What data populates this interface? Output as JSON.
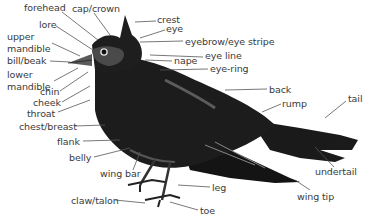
{
  "diagram": {
    "colors": {
      "background": "#ffffff",
      "label_text": "#3a3a3a",
      "leader_line": "#555555",
      "bird_body": "#1a1a1a",
      "bird_highlight": "#6a6a6a"
    },
    "labels": [
      {
        "id": "forehead",
        "text": "forehead",
        "x": 24,
        "y": 6
      },
      {
        "id": "cap-crown",
        "text": "cap/crown",
        "x": 72,
        "y": 7
      },
      {
        "id": "crest",
        "text": "crest",
        "x": 157,
        "y": 17
      },
      {
        "id": "eye",
        "text": "eye",
        "x": 166,
        "y": 26
      },
      {
        "id": "lore",
        "text": "lore",
        "x": 39,
        "y": 20
      },
      {
        "id": "upper-mandible",
        "text": "upper\nmandible",
        "x": 7,
        "y": 30
      },
      {
        "id": "eyebrow-eye-stripe",
        "text": "eyebrow/eye stripe",
        "x": 185,
        "y": 37
      },
      {
        "id": "bill-beak",
        "text": "bill/beak",
        "x": 7,
        "y": 55
      },
      {
        "id": "eye-line",
        "text": "eye line",
        "x": 205,
        "y": 53
      },
      {
        "id": "nape",
        "text": "nape",
        "x": 174,
        "y": 57
      },
      {
        "id": "eye-ring",
        "text": "eye-ring",
        "x": 210,
        "y": 65
      },
      {
        "id": "lower-mandible",
        "text": "lower\nmandible",
        "x": 7,
        "y": 68
      },
      {
        "id": "chin",
        "text": "chin",
        "x": 39,
        "y": 87
      },
      {
        "id": "back",
        "text": "back",
        "x": 269,
        "y": 85
      },
      {
        "id": "cheek",
        "text": "cheek",
        "x": 32,
        "y": 98
      },
      {
        "id": "rump",
        "text": "rump",
        "x": 282,
        "y": 99
      },
      {
        "id": "tail",
        "text": "tail",
        "x": 348,
        "y": 95
      },
      {
        "id": "throat",
        "text": "throat",
        "x": 27,
        "y": 108
      },
      {
        "id": "chest-breast",
        "text": "chest/breast",
        "x": 19,
        "y": 122
      },
      {
        "id": "flank",
        "text": "flank",
        "x": 57,
        "y": 137
      },
      {
        "id": "undertail",
        "text": "undertail",
        "x": 315,
        "y": 168
      },
      {
        "id": "belly",
        "text": "belly",
        "x": 69,
        "y": 153
      },
      {
        "id": "wing-bar",
        "text": "wing bar",
        "x": 100,
        "y": 169
      },
      {
        "id": "leg",
        "text": "leg",
        "x": 212,
        "y": 183
      },
      {
        "id": "wing-tip",
        "text": "wing tip",
        "x": 297,
        "y": 192
      },
      {
        "id": "claw-talon",
        "text": "claw/talon",
        "x": 71,
        "y": 196
      },
      {
        "id": "toe",
        "text": "toe",
        "x": 200,
        "y": 207
      }
    ]
  }
}
